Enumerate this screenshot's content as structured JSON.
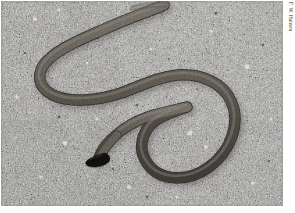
{
  "figure": {
    "kind": "photograph",
    "caption_text": "",
    "credit": "F. W. Hansen",
    "frame": {
      "x": 1,
      "y": 1,
      "width": 282,
      "height": 205,
      "page_background": "#ffffff"
    }
  },
  "photo": {
    "palette": {
      "substrate_base": "#a9a7a3",
      "substrate_light": "#d8d6d1",
      "substrate_mid": "#8e8c88",
      "substrate_dark": "#55534f",
      "substrate_shadow": "#3a3936",
      "snake_body": "#6e6a64",
      "snake_body_light": "#8f8a82",
      "snake_body_dark": "#4a4742",
      "snake_highlight": "#a8a29a",
      "snake_head": "#100f0e",
      "snake_outline": "#353330"
    },
    "scene": {
      "substrate": "coarse mottled granite sand with scattered light and dark grains",
      "lighting": "diffuse overhead daylight, soft shadow under snake body",
      "animal": {
        "common_name": "crowned snake",
        "description": "slender grey-brown snake with glossy black blunt head, body coiled in a loose S with one large open loop at right",
        "head_position_px": [
          95,
          160
        ],
        "head_color": "#100f0e",
        "tail_exit_edge": "top",
        "body_width_px": 9
      }
    }
  }
}
